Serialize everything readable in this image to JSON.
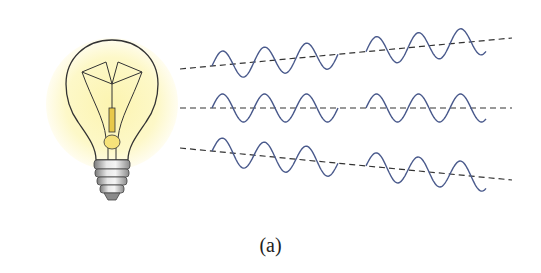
{
  "figure": {
    "caption": "(a)",
    "colors": {
      "glow": "#fdf8c8",
      "glow_edge": "#fffdf0",
      "bulb_outline": "#333333",
      "filament": "#e8c84a",
      "filament_core": "#f6e27a",
      "base_light": "#e6e6e6",
      "base_dark": "#8a8a8a",
      "wave": "#4a5a8c",
      "dashed_line": "#333333"
    },
    "rays": [
      {
        "name": "ray-top",
        "x1": 180,
        "y1": 69,
        "x2": 512,
        "y2": 38
      },
      {
        "name": "ray-middle",
        "x1": 180,
        "y1": 108,
        "x2": 512,
        "y2": 108
      },
      {
        "name": "ray-bottom",
        "x1": 180,
        "y1": 148,
        "x2": 512,
        "y2": 180
      }
    ],
    "wave_groups": [
      {
        "x_start": 212,
        "x_end": 338
      },
      {
        "x_start": 366,
        "x_end": 486
      }
    ],
    "wave_amplitude": 14,
    "wave_wavelength": 42
  }
}
